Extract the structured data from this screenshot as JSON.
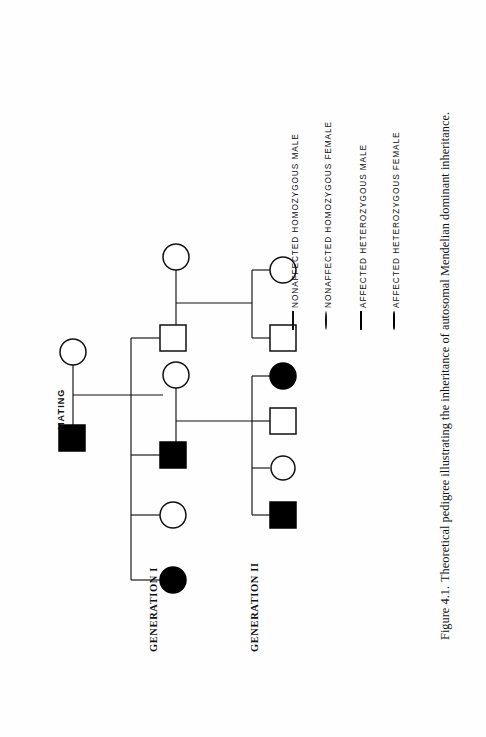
{
  "figure": {
    "number": "Figure 4.1.",
    "caption": "Theoretical pedigree illustrating the inheritance of autosomal Mendelian dominant inheritance.",
    "full_caption": "Figure 4.1.  Theoretical pedigree illustrating the inheritance of autosomal Mendelian dominant inheritance."
  },
  "pedigree": {
    "orientation": "rotated-90",
    "mating_label": "MATING",
    "generations": [
      {
        "id": "gen1",
        "label": "GENERATION I"
      },
      {
        "id": "gen2",
        "label": "GENERATION II"
      }
    ],
    "individuals": [
      {
        "id": "I-1",
        "generation": "I",
        "sex": "male",
        "status": "affected",
        "symbol": "filled-square"
      },
      {
        "id": "I-2",
        "generation": "I",
        "sex": "female",
        "status": "nonaffected",
        "symbol": "open-circle"
      },
      {
        "id": "II-1",
        "generation": "II",
        "sex": "female",
        "status": "affected",
        "symbol": "filled-circle"
      },
      {
        "id": "II-2",
        "generation": "II",
        "sex": "female",
        "status": "nonaffected",
        "symbol": "open-circle"
      },
      {
        "id": "II-3",
        "generation": "II",
        "sex": "male",
        "status": "affected",
        "symbol": "filled-square"
      },
      {
        "id": "II-3s",
        "generation": "II",
        "sex": "female",
        "status": "nonaffected",
        "symbol": "open-circle"
      },
      {
        "id": "II-4",
        "generation": "II",
        "sex": "male",
        "status": "nonaffected",
        "symbol": "open-square"
      },
      {
        "id": "II-4s",
        "generation": "II",
        "sex": "female",
        "status": "nonaffected",
        "symbol": "open-circle"
      },
      {
        "id": "III-1",
        "generation": "III",
        "sex": "female",
        "status": "affected",
        "symbol": "filled-circle"
      },
      {
        "id": "III-2",
        "generation": "III",
        "sex": "male",
        "status": "nonaffected",
        "symbol": "open-square"
      },
      {
        "id": "III-3",
        "generation": "III",
        "sex": "female",
        "status": "nonaffected",
        "symbol": "open-circle"
      },
      {
        "id": "III-4",
        "generation": "III",
        "sex": "male",
        "status": "affected",
        "symbol": "filled-square"
      },
      {
        "id": "III-5",
        "generation": "III",
        "sex": "female",
        "status": "nonaffected",
        "symbol": "open-circle"
      },
      {
        "id": "III-6",
        "generation": "III",
        "sex": "male",
        "status": "nonaffected",
        "symbol": "open-square"
      }
    ]
  },
  "legend": {
    "entries": [
      {
        "symbol": "open-square",
        "label": "NONAFFECTED HOMOZYGOUS MALE"
      },
      {
        "symbol": "open-circle",
        "label": "NONAFFECTED HOMOZYGOUS FEMALE"
      },
      {
        "symbol": "filled-square",
        "label": "AFFECTED HETEROZYGOUS MALE"
      },
      {
        "symbol": "filled-circle",
        "label": "AFFECTED HETEROZYGOUS FEMALE"
      }
    ]
  },
  "colors": {
    "ink": "#111111",
    "affected": "#000000",
    "paper": "#ffffff"
  }
}
